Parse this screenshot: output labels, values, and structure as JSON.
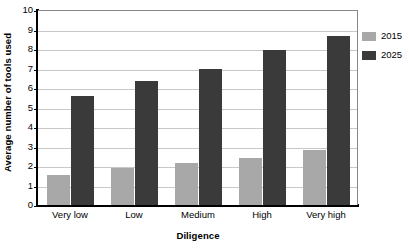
{
  "chart_data": {
    "type": "bar",
    "title": "",
    "xlabel": "Diligence",
    "ylabel": "Average number of tools used",
    "categories": [
      "Very low",
      "Low",
      "Medium",
      "High",
      "Very high"
    ],
    "series": [
      {
        "name": "2015",
        "color": "#a8a8a8",
        "values": [
          1.55,
          1.9,
          2.15,
          2.4,
          2.8
        ]
      },
      {
        "name": "2025",
        "color": "#3a3a3a",
        "values": [
          5.6,
          6.35,
          7.0,
          7.95,
          8.65
        ]
      }
    ],
    "ylim": [
      0,
      10
    ],
    "yticks": [
      0,
      1,
      2,
      3,
      4,
      5,
      6,
      7,
      8,
      9,
      10
    ],
    "ytick_labels": [
      "0",
      "1",
      "2",
      "3",
      "4",
      "5",
      "6",
      "7",
      "8",
      "9",
      "10"
    ],
    "grid": true,
    "grid_axis": "y",
    "legend_position": "right",
    "plot_border_color": "#888888",
    "axis_color": "#000000",
    "grid_color": "#c8c8c8",
    "background": "#ffffff"
  }
}
